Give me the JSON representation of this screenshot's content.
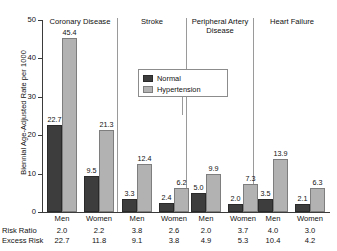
{
  "chart_data": {
    "type": "bar",
    "title": "",
    "xlabel": "",
    "ylabel": "Biennial Age-Adjusted Rate per 1000",
    "ylim": [
      0,
      50
    ],
    "yticks": [
      "0",
      "10",
      "20",
      "30",
      "40",
      "50"
    ],
    "grid": false,
    "legend": {
      "position": "top-center",
      "entries": [
        {
          "name": "Normal",
          "color": "#3d3d3d"
        },
        {
          "name": "Hypertension",
          "color": "#b2b2b2"
        }
      ]
    },
    "groups": [
      {
        "title": "Coronary Disease",
        "categories": [
          "Men",
          "Women"
        ],
        "series": [
          {
            "name": "Normal",
            "values": [
              22.7,
              9.5
            ]
          },
          {
            "name": "Hypertension",
            "values": [
              45.4,
              21.3
            ]
          }
        ],
        "risk_ratio": [
          "2.0",
          "2.2"
        ],
        "excess_risk": [
          "22.7",
          "11.8"
        ]
      },
      {
        "title": "Stroke",
        "categories": [
          "Men",
          "Women"
        ],
        "series": [
          {
            "name": "Normal",
            "values": [
              3.3,
              2.4
            ]
          },
          {
            "name": "Hypertension",
            "values": [
              12.4,
              6.2
            ]
          }
        ],
        "risk_ratio": [
          "3.8",
          "2.6"
        ],
        "excess_risk": [
          "9.1",
          "3.8"
        ]
      },
      {
        "title": "Peripheral Artery\nDisease",
        "categories": [
          "Men",
          "Women"
        ],
        "series": [
          {
            "name": "Normal",
            "values": [
              5.0,
              2.0
            ]
          },
          {
            "name": "Hypertension",
            "values": [
              9.9,
              7.3
            ]
          }
        ],
        "risk_ratio": [
          "2.0",
          "3.7"
        ],
        "excess_risk": [
          "4.9",
          "5.3"
        ]
      },
      {
        "title": "Heart Failure",
        "categories": [
          "Men",
          "Women"
        ],
        "series": [
          {
            "name": "Normal",
            "values": [
              3.5,
              2.1
            ]
          },
          {
            "name": "Hypertension",
            "values": [
              13.9,
              6.3
            ]
          }
        ],
        "risk_ratio": [
          "4.0",
          "3.0"
        ],
        "excess_risk": [
          "10.4",
          "4.2"
        ]
      }
    ],
    "table_rows": [
      {
        "label": "Risk Ratio",
        "values": [
          "2.0",
          "2.2",
          "3.8",
          "2.6",
          "2.0",
          "3.7",
          "4.0",
          "3.0"
        ]
      },
      {
        "label": "Excess Risk",
        "values": [
          "22.7",
          "11.8",
          "9.1",
          "3.8",
          "4.9",
          "5.3",
          "10.4",
          "4.2"
        ]
      }
    ]
  },
  "axis": {
    "ylabel": "Biennial Age-Adjusted Rate per 1000",
    "ticks": [
      "50",
      "40",
      "30",
      "20",
      "10",
      "0"
    ]
  },
  "legend": {
    "normal_label": "Normal",
    "hypertension_label": "Hypertension"
  },
  "groups": {
    "g0_title": "Coronary Disease",
    "g1_title": "Stroke",
    "g2_title": "Peripheral Artery\nDisease",
    "g3_title": "Heart Failure"
  },
  "table": {
    "risk_ratio_label": "Risk Ratio",
    "excess_risk_label": "Excess Risk"
  }
}
